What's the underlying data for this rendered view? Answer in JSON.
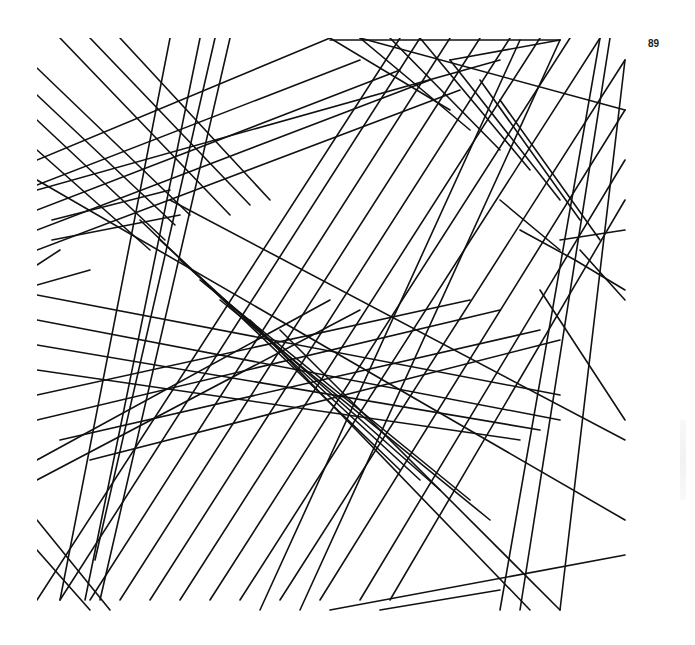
{
  "page": {
    "number": "89",
    "background": "#ffffff",
    "ink_color": "#111111"
  },
  "artwork": {
    "description": "Abstract geometric line drawing of overlapping parallel-line bands crossing at many angles",
    "frame": {
      "x": 37,
      "y": 38,
      "width": 590,
      "height": 575
    },
    "stroke_width": 1.6,
    "lines": [
      [
        37,
        68,
        190,
        215
      ],
      [
        37,
        95,
        175,
        225
      ],
      [
        37,
        120,
        165,
        240
      ],
      [
        37,
        150,
        150,
        250
      ],
      [
        60,
        38,
        230,
        215
      ],
      [
        90,
        38,
        250,
        205
      ],
      [
        120,
        38,
        270,
        200
      ],
      [
        170,
        38,
        60,
        600
      ],
      [
        200,
        38,
        85,
        600
      ],
      [
        230,
        38,
        100,
        600
      ],
      [
        215,
        38,
        95,
        560
      ],
      [
        37,
        160,
        330,
        38
      ],
      [
        37,
        185,
        360,
        60
      ],
      [
        37,
        210,
        400,
        70
      ],
      [
        37,
        230,
        430,
        80
      ],
      [
        37,
        250,
        460,
        90
      ],
      [
        37,
        190,
        500,
        60
      ],
      [
        52,
        220,
        170,
        190
      ],
      [
        52,
        240,
        180,
        215
      ],
      [
        37,
        265,
        60,
        250
      ],
      [
        37,
        285,
        90,
        270
      ],
      [
        37,
        180,
        625,
        520
      ],
      [
        170,
        200,
        625,
        440
      ],
      [
        37,
        295,
        560,
        395
      ],
      [
        37,
        320,
        560,
        420
      ],
      [
        37,
        345,
        540,
        430
      ],
      [
        37,
        370,
        520,
        440
      ],
      [
        37,
        395,
        470,
        300
      ],
      [
        37,
        420,
        500,
        310
      ],
      [
        60,
        440,
        540,
        330
      ],
      [
        90,
        460,
        560,
        340
      ],
      [
        37,
        460,
        330,
        300
      ],
      [
        37,
        480,
        360,
        310
      ],
      [
        140,
        220,
        400,
        470
      ],
      [
        160,
        240,
        420,
        480
      ],
      [
        180,
        260,
        440,
        490
      ],
      [
        200,
        280,
        470,
        500
      ],
      [
        220,
        300,
        490,
        520
      ],
      [
        250,
        320,
        530,
        610
      ],
      [
        280,
        330,
        560,
        610
      ],
      [
        37,
        600,
        400,
        38
      ],
      [
        60,
        600,
        420,
        38
      ],
      [
        90,
        600,
        450,
        38
      ],
      [
        120,
        600,
        480,
        38
      ],
      [
        150,
        600,
        510,
        38
      ],
      [
        180,
        600,
        540,
        38
      ],
      [
        210,
        600,
        570,
        38
      ],
      [
        240,
        600,
        600,
        38
      ],
      [
        280,
        600,
        625,
        60
      ],
      [
        320,
        600,
        625,
        110
      ],
      [
        360,
        600,
        625,
        160
      ],
      [
        390,
        600,
        625,
        200
      ],
      [
        330,
        38,
        450,
        110
      ],
      [
        360,
        38,
        470,
        130
      ],
      [
        390,
        38,
        500,
        150
      ],
      [
        420,
        38,
        530,
        170
      ],
      [
        450,
        60,
        560,
        200
      ],
      [
        480,
        80,
        580,
        220
      ],
      [
        500,
        100,
        600,
        240
      ],
      [
        360,
        38,
        625,
        110
      ],
      [
        330,
        40,
        560,
        40
      ],
      [
        450,
        60,
        560,
        40
      ],
      [
        500,
        200,
        560,
        250
      ],
      [
        520,
        230,
        575,
        260
      ],
      [
        560,
        240,
        625,
        230
      ],
      [
        575,
        260,
        625,
        290
      ],
      [
        540,
        290,
        625,
        420
      ],
      [
        580,
        250,
        625,
        300
      ],
      [
        600,
        38,
        500,
        610
      ],
      [
        610,
        38,
        520,
        610
      ],
      [
        625,
        60,
        560,
        610
      ],
      [
        330,
        610,
        625,
        555
      ],
      [
        380,
        610,
        500,
        590
      ],
      [
        37,
        520,
        110,
        610
      ],
      [
        37,
        550,
        90,
        610
      ],
      [
        560,
        40,
        300,
        610
      ],
      [
        520,
        40,
        260,
        610
      ]
    ]
  }
}
